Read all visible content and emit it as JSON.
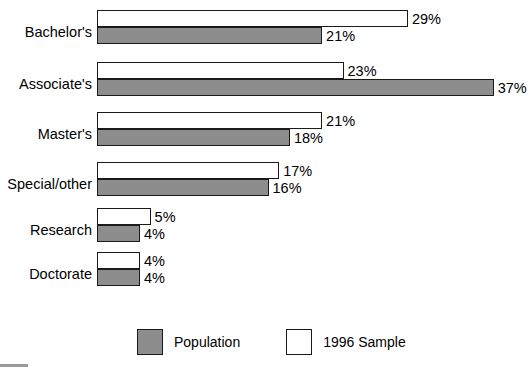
{
  "chart_data": {
    "type": "bar",
    "orientation": "horizontal",
    "title": "",
    "subtitle": "",
    "xlabel": "",
    "ylabel": "",
    "xlim": [
      0,
      37
    ],
    "grid": false,
    "legend_position": "bottom",
    "value_suffix": "%",
    "categories": [
      "Bachelor's",
      "Associate's",
      "Master's",
      "Special/other",
      "Research",
      "Doctorate"
    ],
    "series": [
      {
        "name": "1996 Sample",
        "color": "#ffffff",
        "values": [
          29,
          23,
          21,
          17,
          5,
          4
        ],
        "labels": [
          "29%",
          "23%",
          "21%",
          "17%",
          "5%",
          "4%"
        ]
      },
      {
        "name": "Population",
        "color": "#8d8d8d",
        "values": [
          21,
          37,
          18,
          16,
          4,
          4
        ],
        "labels": [
          "21%",
          "37%",
          "18%",
          "16%",
          "4%",
          "4%"
        ]
      }
    ]
  },
  "legend": {
    "entries": [
      {
        "label": "Population",
        "swatch": "population"
      },
      {
        "label": "1996 Sample",
        "swatch": "sample"
      }
    ]
  }
}
